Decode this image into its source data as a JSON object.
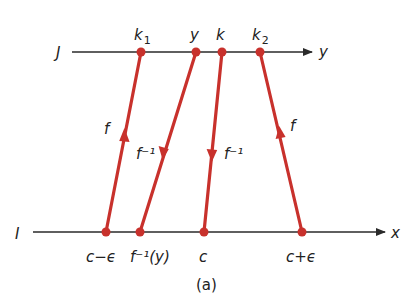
{
  "colors": {
    "axis": "#2a2a2a",
    "map": "#c8312c",
    "text": "#222222"
  },
  "axes": {
    "top": {
      "name": "J",
      "end_label": "y",
      "y": 52,
      "x1": 72,
      "x2": 312
    },
    "bottom": {
      "name": "I",
      "end_label": "x",
      "y": 232,
      "x1": 33,
      "x2": 385
    }
  },
  "top_points": [
    {
      "id": "k1",
      "label": "k",
      "sub": "1",
      "x": 141
    },
    {
      "id": "y",
      "label": "y",
      "sub": "",
      "x": 196
    },
    {
      "id": "k",
      "label": "k",
      "sub": "",
      "x": 222
    },
    {
      "id": "k2",
      "label": "k",
      "sub": "2",
      "x": 260
    }
  ],
  "bottom_points": [
    {
      "id": "c-eps",
      "label": "c−ϵ",
      "x": 106
    },
    {
      "id": "finv-y",
      "label": "f⁻¹(y)",
      "x": 140
    },
    {
      "id": "c",
      "label": "c",
      "x": 204
    },
    {
      "id": "c+eps",
      "label": "c+ϵ",
      "x": 302
    }
  ],
  "mappings": [
    {
      "from": "c-eps",
      "to": "k1",
      "direction": "up",
      "label": "f"
    },
    {
      "from": "finv-y",
      "to": "y",
      "direction": "down",
      "label": "f⁻¹"
    },
    {
      "from": "c",
      "to": "k",
      "direction": "down",
      "label": "f⁻¹"
    },
    {
      "from": "c+eps",
      "to": "k2",
      "direction": "up",
      "label": "f"
    }
  ],
  "caption": "(a)"
}
